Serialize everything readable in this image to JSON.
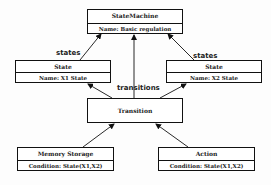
{
  "diagram": {
    "nodes": {
      "state_machine": {
        "title": "StateMachine",
        "attribute": "Name: Basic regulation"
      },
      "state_left": {
        "title": "State",
        "attribute": "Name: X1 State"
      },
      "state_right": {
        "title": "State",
        "attribute": "Name: X2 State"
      },
      "transition": {
        "title": "Transition"
      },
      "memory_storage": {
        "title": "Memory Storage",
        "attribute": "Condition: State(X1,X2)"
      },
      "action": {
        "title": "Action",
        "attribute": "Condition: State(X1,X2)"
      }
    },
    "edge_labels": {
      "states_left": "states",
      "states_right": "states",
      "transitions": "transitions"
    },
    "edges": [
      {
        "from": "State (X1)",
        "to": "StateMachine",
        "label": "states"
      },
      {
        "from": "State (X2)",
        "to": "StateMachine",
        "label": "states"
      },
      {
        "from": "Transition",
        "to": "StateMachine",
        "label": "transitions"
      },
      {
        "from": "Transition",
        "to": "State (X1)"
      },
      {
        "from": "Transition",
        "to": "State (X2)"
      },
      {
        "from": "Memory Storage",
        "to": "Transition"
      },
      {
        "from": "Action",
        "to": "Transition"
      }
    ],
    "colors": {
      "line": "#111111",
      "text": "#222222",
      "background": "#ffffff"
    }
  }
}
